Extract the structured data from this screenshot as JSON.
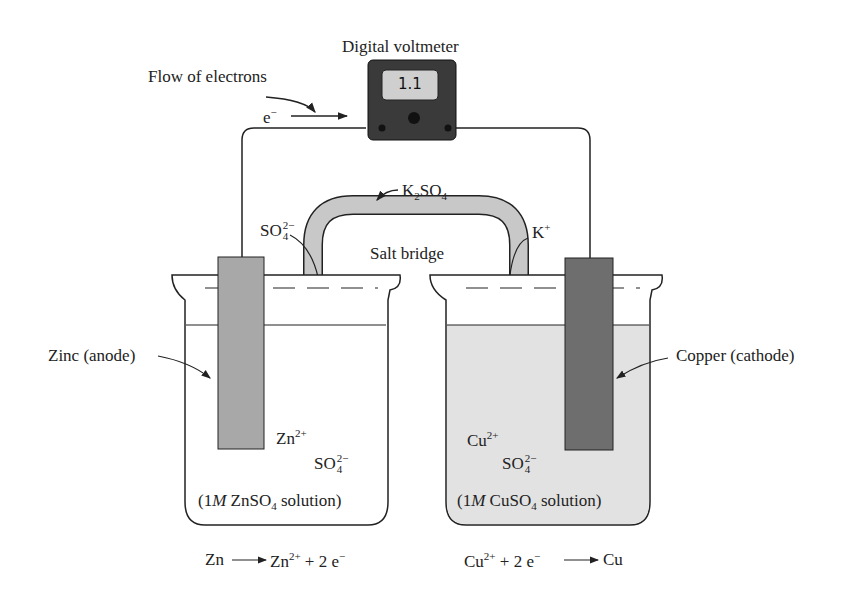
{
  "title": "Digital voltmeter",
  "meter_reading": "1.1",
  "flow_label": "Flow of electrons",
  "electron_symbol": "e",
  "electron_charge": "−",
  "salt_bridge": {
    "label": "Salt bridge",
    "compound": "K",
    "compound_sub1": "2",
    "compound_mid": "SO",
    "compound_sub2": "4"
  },
  "left_ion_migrating": {
    "base": "SO",
    "sub": "4",
    "sup": "2−"
  },
  "right_ion_migrating": {
    "base": "K",
    "sup": "+"
  },
  "anode": {
    "label": "Zinc (anode)",
    "cation": {
      "base": "Zn",
      "sup": "2+"
    },
    "anion": {
      "base": "SO",
      "sub": "4",
      "sup": "2−"
    },
    "solution_prefix": "(1",
    "solution_M": "M",
    "solution_formula": " ZnSO",
    "solution_sub": "4",
    "solution_suffix": " solution)",
    "half_reaction": {
      "left": "Zn",
      "right_base": "Zn",
      "right_sup": "2+",
      "right_rest": "+ 2 e",
      "right_e_sup": "−"
    }
  },
  "cathode": {
    "label": "Copper (cathode)",
    "cation": {
      "base": "Cu",
      "sup": "2+"
    },
    "anion": {
      "base": "SO",
      "sub": "4",
      "sup": "2−"
    },
    "solution_prefix": "(1",
    "solution_M": "M",
    "solution_formula": " CuSO",
    "solution_sub": "4",
    "solution_suffix": " solution)",
    "half_reaction": {
      "left_base": "Cu",
      "left_sup": "2+",
      "left_rest": "+ 2 e",
      "left_e_sup": "−",
      "right": "Cu"
    }
  },
  "colors": {
    "zinc": "#a8a8a8",
    "copper": "#6e6e6e",
    "cuso4_solution": "#e2e2e2",
    "bridge": "#c8c8c8",
    "meter": "#3a3a3a",
    "display": "#cfcfcf"
  }
}
